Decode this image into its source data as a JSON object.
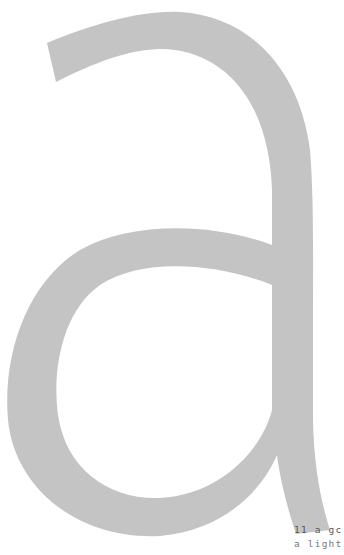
{
  "page": {
    "type": "scanned-page-fragment",
    "background": "#ffffff"
  },
  "glyph": {
    "character": "a",
    "style": "single-story sans-serif, large display letterform",
    "color": "#c4c4c4"
  },
  "caption": {
    "lines": [
      "11 a gc",
      "a light"
    ],
    "color": "#666666"
  }
}
